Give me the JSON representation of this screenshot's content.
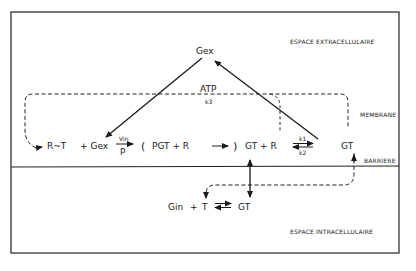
{
  "diagram": {
    "regions": {
      "extracellular": "ESPACE  EXTRACELLULAIRE",
      "membrane": "MEMBRANE",
      "barrier": "BARRIERE",
      "intracellular": "ESPACE  INTRACELLULAIRE"
    },
    "top": {
      "gex": "Gex",
      "atp": "ATP",
      "k3": "k3"
    },
    "reaction": {
      "rt": "R~T",
      "plus_gex": "+ Gex",
      "vin": "Vin",
      "p": "P",
      "open_paren": "(",
      "pgt_r": "PGT  +  R",
      "close_paren": ")",
      "gt_r": "GT + R",
      "k1": "k1",
      "k2": "k2",
      "gt_right": "GT"
    },
    "bottom": {
      "gin": "Gin",
      "plus": "+",
      "t": "T",
      "gt": "GT"
    }
  }
}
